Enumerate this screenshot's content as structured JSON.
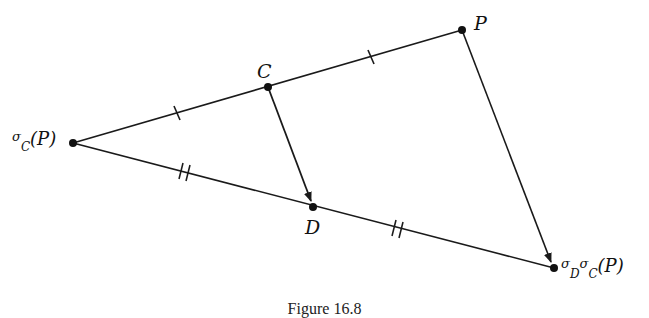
{
  "diagram": {
    "points": {
      "sigmaC_P": {
        "x": 73,
        "y": 143
      },
      "C": {
        "x": 268,
        "y": 87
      },
      "P": {
        "x": 462,
        "y": 30
      },
      "D": {
        "x": 313,
        "y": 207
      },
      "sigmaD_sigmaC_P": {
        "x": 554,
        "y": 268
      }
    },
    "labels": {
      "P": "P",
      "C": "C",
      "D": "D",
      "sigmaC_P": {
        "sigma": "σ",
        "sub": "C",
        "arg": "(P)"
      },
      "sigmaD_sigmaC_P": {
        "sigma1": "σ",
        "sub1": "D",
        "sigma2": "σ",
        "sub2": "C",
        "arg": "(P)"
      }
    },
    "segments": [
      {
        "from": "sigmaC_P",
        "to": "P",
        "ticks": "single on each half (C is midpoint)"
      },
      {
        "from": "sigmaC_P",
        "to": "sigmaD_sigmaC_P",
        "ticks": "double on each half (D is midpoint)"
      },
      {
        "from": "C",
        "to": "D",
        "arrow": true
      },
      {
        "from": "P",
        "to": "sigmaD_sigmaC_P",
        "arrow": true
      }
    ],
    "caption": "Figure 16.8",
    "line_color": "#1a1a1a"
  }
}
